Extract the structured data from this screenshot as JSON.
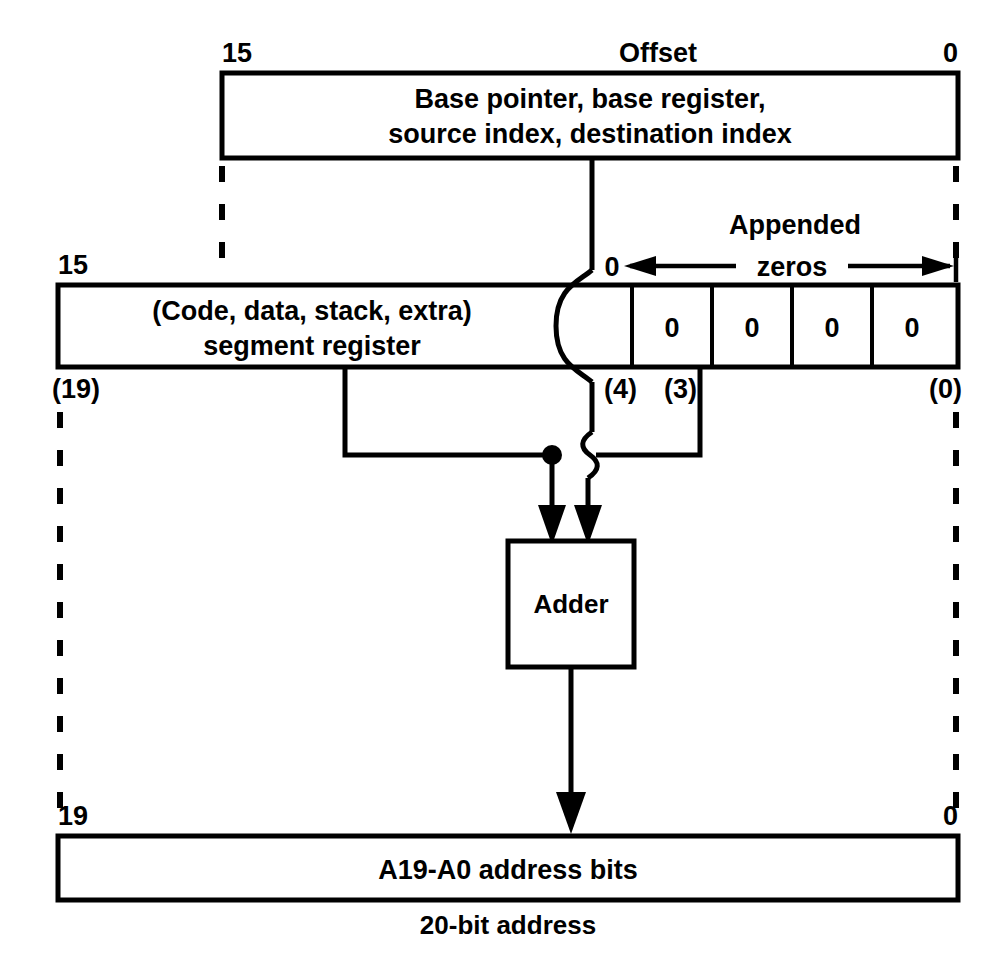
{
  "diagram": {
    "colors": {
      "line": "#000000",
      "background": "#ffffff",
      "text": "#000000"
    },
    "offset_register": {
      "left_bit_label": "15",
      "right_bit_label": "0",
      "top_caption": "Offset",
      "line1": "Base pointer, base register,",
      "line2": "source index, destination index"
    },
    "segment_register": {
      "left_bit_label": "15",
      "right_bit_label": "0",
      "line1": "(Code, data, stack, extra)",
      "line2": "segment register",
      "appended_label_line1": "Appended",
      "appended_label_line2": "zeros",
      "zero_cells": [
        "0",
        "0",
        "0",
        "0"
      ],
      "lower_bit_labels": {
        "left": "(19)",
        "mid_left": "(4)",
        "mid_right": "(3)",
        "right": "(0)"
      }
    },
    "adder": {
      "label": "Adder"
    },
    "address_bus": {
      "left_bit_label": "19",
      "right_bit_label": "0",
      "label": "A19-A0 address bits",
      "caption": "20-bit address"
    }
  }
}
